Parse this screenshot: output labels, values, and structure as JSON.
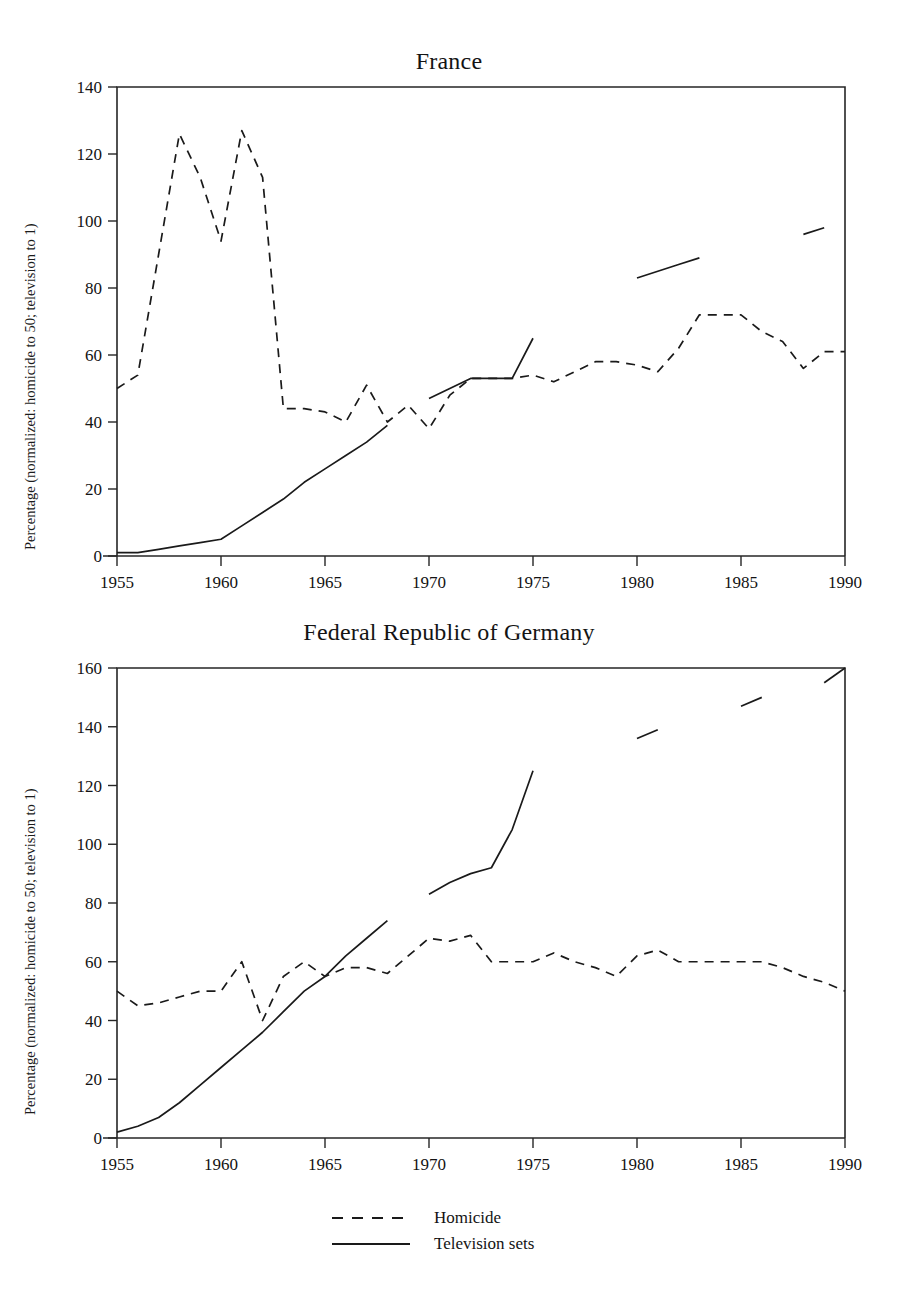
{
  "figure": {
    "background_color": "#ffffff",
    "ink_color": "#1a1a1a"
  },
  "legend": {
    "position": "bottom-center",
    "entries": [
      {
        "label": "Homicide",
        "style": "dashed",
        "swatch_name": "dashed-line-swatch"
      },
      {
        "label": "Television sets",
        "style": "solid",
        "swatch_name": "solid-line-swatch"
      }
    ]
  },
  "chart_data": [
    {
      "type": "line",
      "title": "France",
      "xlabel": "",
      "ylabel": "Percentage (normalized: homicide to 50; television to 1)",
      "xlim": [
        1955,
        1990
      ],
      "ylim": [
        0,
        140
      ],
      "xticks": [
        1955,
        1960,
        1965,
        1970,
        1975,
        1980,
        1985,
        1990
      ],
      "yticks": [
        0,
        20,
        40,
        60,
        80,
        100,
        120,
        140
      ],
      "xtick_labels": [
        "1955",
        "1960",
        "1965",
        "1970",
        "1975",
        "1980",
        "1985",
        "1990"
      ],
      "ytick_labels": [
        "0",
        "20",
        "40",
        "60",
        "80",
        "100",
        "120",
        "140"
      ],
      "grid": false,
      "legend_position": "figure-bottom",
      "series": [
        {
          "name": "Homicide",
          "style": "dashed",
          "x": [
            1955,
            1956,
            1957,
            1958,
            1959,
            1960,
            1961,
            1962,
            1963,
            1964,
            1965,
            1966,
            1967,
            1968,
            1969,
            1970,
            1971,
            1972,
            1973,
            1974,
            1975,
            1976,
            1977,
            1978,
            1979,
            1980,
            1981,
            1982,
            1983,
            1984,
            1985,
            1986,
            1987,
            1988,
            1989,
            1990
          ],
          "values": [
            50,
            54,
            90,
            126,
            113,
            94,
            127,
            113,
            44,
            44,
            43,
            40,
            51,
            40,
            45,
            38,
            48,
            53,
            53,
            53,
            54,
            52,
            55,
            58,
            58,
            57,
            55,
            62,
            72,
            72,
            72,
            67,
            64,
            56,
            61,
            61
          ]
        },
        {
          "name": "Television sets",
          "style": "solid",
          "segments": [
            {
              "x": [
                1955,
                1956,
                1957,
                1958,
                1959,
                1960,
                1961,
                1962,
                1963,
                1964,
                1965,
                1966,
                1967,
                1968
              ],
              "values": [
                1,
                1,
                2,
                3,
                4,
                5,
                9,
                13,
                17,
                22,
                26,
                30,
                34,
                39
              ]
            },
            {
              "x": [
                1970,
                1971,
                1972,
                1973,
                1974,
                1975
              ],
              "values": [
                47,
                50,
                53,
                53,
                53,
                65
              ]
            },
            {
              "x": [
                1980,
                1981,
                1982,
                1983
              ],
              "values": [
                83,
                85,
                87,
                89
              ]
            },
            {
              "x": [
                1988,
                1989
              ],
              "values": [
                96,
                98
              ]
            }
          ]
        }
      ]
    },
    {
      "type": "line",
      "title": "Federal Republic of Germany",
      "xlabel": "",
      "ylabel": "Percentage (normalized: homicide to 50; television to 1)",
      "xlim": [
        1955,
        1990
      ],
      "ylim": [
        0,
        160
      ],
      "xticks": [
        1955,
        1960,
        1965,
        1970,
        1975,
        1980,
        1985,
        1990
      ],
      "yticks": [
        0,
        20,
        40,
        60,
        80,
        100,
        120,
        140,
        160
      ],
      "xtick_labels": [
        "1955",
        "1960",
        "1965",
        "1970",
        "1975",
        "1980",
        "1985",
        "1990"
      ],
      "ytick_labels": [
        "0",
        "20",
        "40",
        "60",
        "80",
        "100",
        "120",
        "140",
        "160"
      ],
      "grid": false,
      "legend_position": "figure-bottom",
      "series": [
        {
          "name": "Homicide",
          "style": "dashed",
          "x": [
            1955,
            1956,
            1957,
            1958,
            1959,
            1960,
            1961,
            1962,
            1963,
            1964,
            1965,
            1966,
            1967,
            1968,
            1969,
            1970,
            1971,
            1972,
            1973,
            1974,
            1975,
            1976,
            1977,
            1978,
            1979,
            1980,
            1981,
            1982,
            1983,
            1984,
            1985,
            1986,
            1987,
            1988,
            1989,
            1990
          ],
          "values": [
            50,
            45,
            46,
            48,
            50,
            50,
            60,
            40,
            55,
            60,
            55,
            58,
            58,
            56,
            62,
            68,
            67,
            69,
            60,
            60,
            60,
            63,
            60,
            58,
            55,
            62,
            64,
            60,
            60,
            60,
            60,
            60,
            58,
            55,
            53,
            50
          ]
        },
        {
          "name": "Television sets",
          "style": "solid",
          "segments": [
            {
              "x": [
                1955,
                1956,
                1957,
                1958,
                1959,
                1960,
                1961,
                1962,
                1963,
                1964,
                1965,
                1966,
                1967,
                1968
              ],
              "values": [
                2,
                4,
                7,
                12,
                18,
                24,
                30,
                36,
                43,
                50,
                55,
                62,
                68,
                74
              ]
            },
            {
              "x": [
                1970,
                1971,
                1972,
                1973,
                1974,
                1975
              ],
              "values": [
                83,
                87,
                90,
                92,
                105,
                125
              ]
            },
            {
              "x": [
                1980,
                1981
              ],
              "values": [
                136,
                139
              ]
            },
            {
              "x": [
                1985,
                1986
              ],
              "values": [
                147,
                150
              ]
            },
            {
              "x": [
                1989,
                1990
              ],
              "values": [
                155,
                160
              ]
            }
          ]
        }
      ]
    }
  ]
}
